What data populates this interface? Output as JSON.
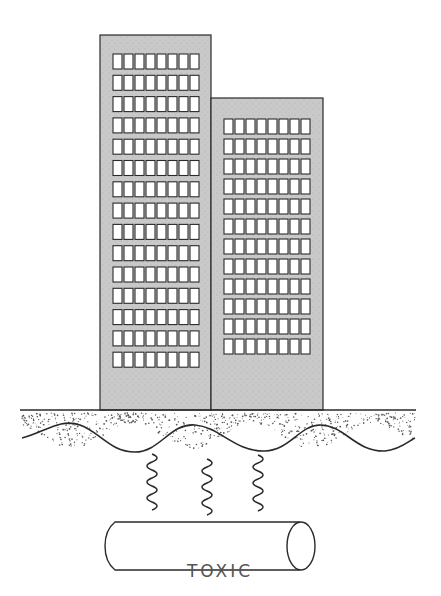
{
  "diagram": {
    "colors": {
      "building_fill": "#c8c8c8",
      "outline": "#2a2a2a",
      "window_fill": "#ffffff",
      "text": "#555555"
    },
    "buildings": [
      {
        "name": "tall-building",
        "x": 100,
        "y": 35,
        "width": 111,
        "height": 375,
        "window_cols": 8,
        "window_rows": 15,
        "first_row_y": 54,
        "row_spacing": 21.3
      },
      {
        "name": "short-building",
        "x": 211,
        "y": 98,
        "width": 112,
        "height": 312,
        "window_cols": 8,
        "window_rows": 12,
        "first_row_y": 119,
        "row_spacing": 20
      }
    ],
    "ground": {
      "surface_y": 410,
      "layer": "speckled soil"
    },
    "springs": {
      "count": 3,
      "meaning": "fumes rising"
    },
    "pipe": {
      "label": "TOXIC"
    }
  }
}
